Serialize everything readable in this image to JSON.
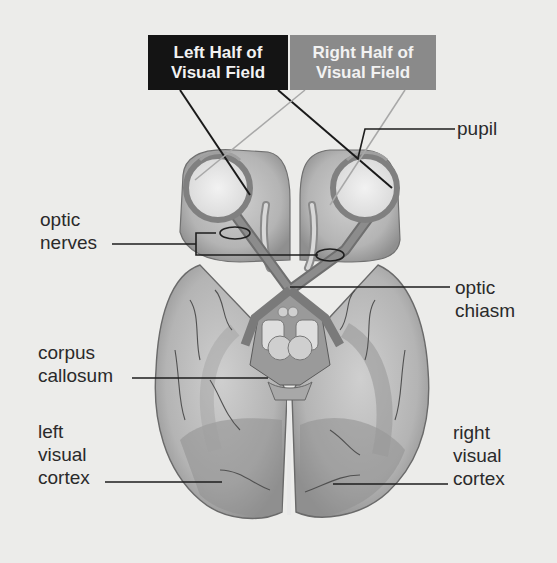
{
  "diagram": {
    "colors": {
      "background": "#ececea",
      "left_field_box": "#141414",
      "right_field_box": "#8a8a8a",
      "brain_fill": "#b8b8b8",
      "leader_line": "#1e1e1e"
    },
    "field_boxes": {
      "left": {
        "line1": "Left Half of",
        "line2": "Visual Field"
      },
      "right": {
        "line1": "Right Half of",
        "line2": "Visual Field"
      }
    },
    "labels": {
      "pupil": {
        "lines": [
          "pupil"
        ]
      },
      "optic_nerves": {
        "lines": [
          "optic",
          "nerves"
        ]
      },
      "optic_chiasm": {
        "lines": [
          "optic",
          "chiasm"
        ]
      },
      "corpus_callosum": {
        "lines": [
          "corpus",
          "callosum"
        ]
      },
      "left_visual_cortex": {
        "lines": [
          "left",
          "visual",
          "cortex"
        ]
      },
      "right_visual_cortex": {
        "lines": [
          "right",
          "visual",
          "cortex"
        ]
      }
    }
  }
}
